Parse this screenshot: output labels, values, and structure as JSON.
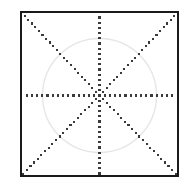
{
  "figure": {
    "title": "Square with inscribed circle and eight-spoke dotted radial pattern",
    "caption": "",
    "background_color": "#ffffff",
    "canvas": {
      "width": 188,
      "height": 188
    }
  },
  "chart_data": {
    "type": "scatter",
    "title": "Square with inscribed circle and eight-spoke dotted radial pattern",
    "subtitle": "",
    "xlabel": "",
    "ylabel": "",
    "grid": false,
    "legend_position": "none",
    "xlim": [
      21,
      178
    ],
    "ylim": [
      12,
      176
    ],
    "tick_labels": {
      "x": [],
      "y": []
    },
    "annotations": [],
    "center": {
      "x": 99.5,
      "y": 95.5
    },
    "square": {
      "label": "outer square frame",
      "x": 21,
      "y": 12,
      "width": 157,
      "height": 164,
      "stroke_color": "#1a1a1a",
      "stroke_width": 1.6,
      "fill_color": "#ffffff"
    },
    "circle": {
      "label": "inscribed circle",
      "cx": 99.5,
      "cy": 95.5,
      "r": 57,
      "stroke_color": "#e6e6e6",
      "stroke_width": 1.4,
      "fill_color": "none"
    },
    "spokes": {
      "label": "eight dotted spokes from center",
      "count": 8,
      "dot_color": "#3a3a3a",
      "dot_size": 2.1,
      "dot_spacing": 5.2,
      "series": [
        {
          "name": "spoke-east",
          "angle_deg": 0,
          "end_x": 178,
          "end_y": 95.5
        },
        {
          "name": "spoke-northeast",
          "angle_deg": 45,
          "end_x": 178,
          "end_y": 12
        },
        {
          "name": "spoke-north",
          "angle_deg": 90,
          "end_x": 99.5,
          "end_y": 12
        },
        {
          "name": "spoke-northwest",
          "angle_deg": 135,
          "end_x": 21,
          "end_y": 12
        },
        {
          "name": "spoke-west",
          "angle_deg": 180,
          "end_x": 21,
          "end_y": 95.5
        },
        {
          "name": "spoke-southwest",
          "angle_deg": 225,
          "end_x": 21,
          "end_y": 176
        },
        {
          "name": "spoke-south",
          "angle_deg": 270,
          "end_x": 99.5,
          "end_y": 176
        },
        {
          "name": "spoke-southeast",
          "angle_deg": 315,
          "end_x": 178,
          "end_y": 176
        }
      ]
    }
  }
}
